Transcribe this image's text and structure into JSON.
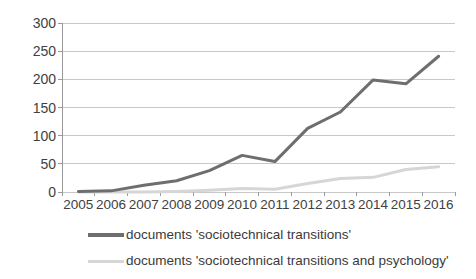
{
  "chart_data": {
    "type": "line",
    "title": "",
    "xlabel": "",
    "ylabel": "",
    "categories": [
      "2005",
      "2006",
      "2007",
      "2008",
      "2009",
      "2010",
      "2011",
      "2012",
      "2013",
      "2014",
      "2015",
      "2016"
    ],
    "ylim": [
      0,
      300
    ],
    "ytick_values": [
      0,
      50,
      100,
      150,
      200,
      250,
      300
    ],
    "ytick_labels": [
      "0",
      "50",
      "100",
      "150",
      "200",
      "250",
      "300"
    ],
    "grid": "horizontal",
    "legend_position": "bottom",
    "series": [
      {
        "name": "documents 'sociotechnical transitions'",
        "color": "#6e6e6e",
        "values": [
          1,
          2,
          12,
          20,
          38,
          65,
          54,
          113,
          142,
          199,
          192,
          241
        ]
      },
      {
        "name": "documents 'sociotechnical transitions and psychology'",
        "color": "#d6d6d6",
        "values": [
          0,
          0,
          0,
          1,
          3,
          6,
          5,
          15,
          24,
          26,
          40,
          45
        ]
      }
    ]
  },
  "legend": {
    "items": [
      {
        "label": "documents 'sociotechnical transitions'",
        "color": "#6e6e6e"
      },
      {
        "label": "documents 'sociotechnical transitions and psychology'",
        "color": "#d6d6d6"
      }
    ]
  },
  "colors": {
    "series_dark": "#6e6e6e",
    "series_light": "#d6d6d6",
    "gridline": "#c8c8c8",
    "axis": "#9a9a9a",
    "text": "#3f3f3f",
    "background": "#ffffff"
  }
}
